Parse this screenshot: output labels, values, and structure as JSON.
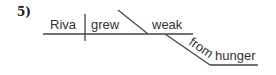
{
  "problem_number": "5)",
  "diagram": {
    "type": "sentence-diagram",
    "subject": "Riva",
    "verb": "grew",
    "predicate_adjective": "weak",
    "modifier_preposition": "from",
    "modifier_object": "hunger",
    "line_color": "#444444",
    "text_color": "#333333"
  }
}
